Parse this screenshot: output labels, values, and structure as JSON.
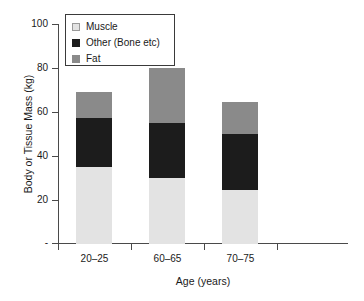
{
  "chart_data": {
    "type": "bar",
    "subtype": "stacked-bar",
    "title": "",
    "xlabel": "Age (years)",
    "ylabel": "Body or Tissue Mass (kg)",
    "categories": [
      "20–25",
      "60–65",
      "70–75"
    ],
    "series": [
      {
        "name": "Muscle",
        "values": [
          35,
          30,
          24.5
        ],
        "color": "#e3e3e3"
      },
      {
        "name": "Other (Bone etc)",
        "values": [
          22.5,
          25,
          25.5
        ],
        "color": "#1c1c1c"
      },
      {
        "name": "Fat",
        "values": [
          11.5,
          25,
          14.5
        ],
        "color": "#8a8a8a"
      }
    ],
    "totals": [
      69,
      80,
      64.5
    ],
    "ylim": [
      0,
      100
    ],
    "ytick_values": [
      0,
      20,
      40,
      60,
      80,
      100
    ],
    "ytick_labels": [
      "-",
      "20",
      "40",
      "60",
      "80",
      "100"
    ],
    "grid": false,
    "legend_position": "upper-left",
    "legend_box": true
  },
  "axes": {
    "y_title": "Body or Tissue Mass (kg)",
    "x_title": "Age (years)",
    "y_ticks": [
      {
        "label": "100",
        "value": 100
      },
      {
        "label": "80",
        "value": 80
      },
      {
        "label": "60",
        "value": 60
      },
      {
        "label": "40",
        "value": 40
      },
      {
        "label": "20",
        "value": 20
      },
      {
        "label": "-",
        "value": 0
      }
    ],
    "x_ticks": [
      {
        "label": "20–25"
      },
      {
        "label": "60–65"
      },
      {
        "label": "70–75"
      }
    ]
  },
  "legend": {
    "items": [
      {
        "label": "Muscle",
        "color": "#e3e3e3"
      },
      {
        "label": "Other (Bone etc)",
        "color": "#1c1c1c"
      },
      {
        "label": "Fat",
        "color": "#8a8a8a"
      }
    ]
  },
  "colors": {
    "muscle": "#e3e3e3",
    "other_bone": "#1c1c1c",
    "fat": "#8a8a8a",
    "axis": "#4a4a4a",
    "text": "#1a1a1a",
    "background": "#ffffff"
  }
}
